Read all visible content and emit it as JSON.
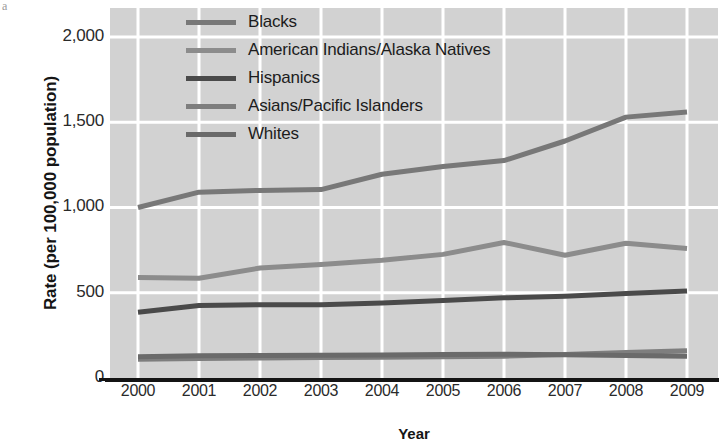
{
  "figure": {
    "corner_mark": "a",
    "background_color": "#ffffff",
    "plot_background_color": "#d2d2d2",
    "gridline_color": "#ffffff",
    "axis_color": "#141414"
  },
  "axes": {
    "y_title": "Rate (per 100,000 population)",
    "x_title": "Year",
    "y_ticks": [
      "0",
      "500",
      "1,000",
      "1,500",
      "2,000"
    ],
    "x_ticks": [
      "2000",
      "2001",
      "2002",
      "2003",
      "2004",
      "2005",
      "2006",
      "2007",
      "2008",
      "2009"
    ]
  },
  "legend": {
    "items": [
      {
        "label": "Blacks",
        "color": "#787878"
      },
      {
        "label": "American Indians/Alaska Natives",
        "color": "#8c8c8c"
      },
      {
        "label": "Hispanics",
        "color": "#4a4a4a"
      },
      {
        "label": "Asians/Pacific Islanders",
        "color": "#7e7e7e"
      },
      {
        "label": "Whites",
        "color": "#6a6a6a"
      }
    ]
  },
  "chart_data": {
    "type": "line",
    "title": "",
    "subtitle": "",
    "xlabel": "Year",
    "ylabel": "Rate (per 100,000 population)",
    "categories": [
      "2000",
      "2001",
      "2002",
      "2003",
      "2004",
      "2005",
      "2006",
      "2007",
      "2008",
      "2009"
    ],
    "x": [
      2000,
      2001,
      2002,
      2003,
      2004,
      2005,
      2006,
      2007,
      2008,
      2009
    ],
    "ylim": [
      0,
      2170
    ],
    "xlim": [
      2000,
      2009
    ],
    "y_gridlines": [
      0,
      500,
      1000,
      1500,
      2000
    ],
    "grid": true,
    "legend_position": "top-center",
    "series": [
      {
        "name": "Blacks",
        "color": "#787878",
        "values": [
          1000,
          1090,
          1100,
          1105,
          1195,
          1240,
          1275,
          1390,
          1530,
          1560
        ]
      },
      {
        "name": "American Indians/Alaska Natives",
        "color": "#8c8c8c",
        "values": [
          590,
          585,
          645,
          665,
          690,
          725,
          795,
          720,
          790,
          760
        ]
      },
      {
        "name": "Hispanics",
        "color": "#4a4a4a",
        "values": [
          385,
          425,
          430,
          430,
          440,
          455,
          470,
          480,
          495,
          510
        ]
      },
      {
        "name": "Asians/Pacific Islanders",
        "color": "#7e7e7e",
        "values": [
          110,
          115,
          118,
          120,
          122,
          125,
          128,
          138,
          150,
          160
        ]
      },
      {
        "name": "Whites",
        "color": "#6a6a6a",
        "values": [
          125,
          130,
          132,
          133,
          135,
          138,
          140,
          136,
          132,
          128
        ]
      }
    ]
  }
}
